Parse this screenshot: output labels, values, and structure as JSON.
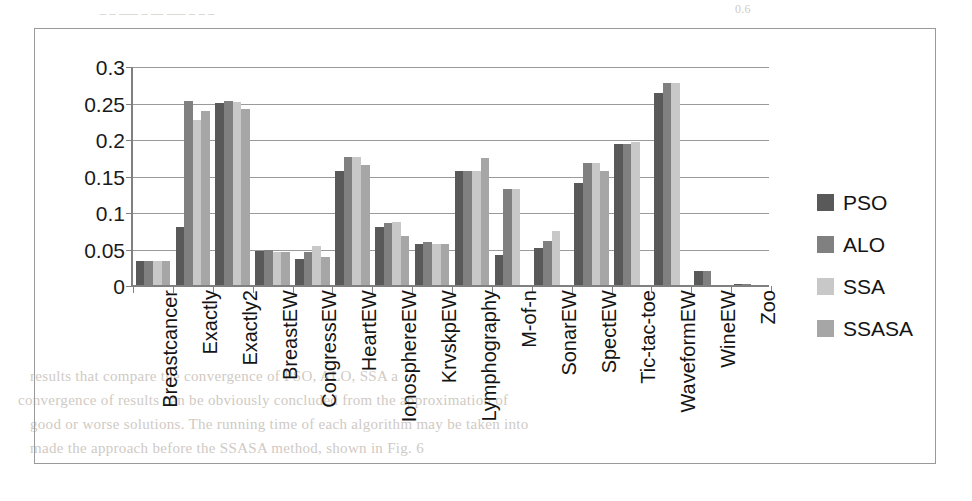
{
  "page_bleed": {
    "top_left": "_  _   ___ _ __  ___ _ _ _",
    "top_right": "0.6",
    "lines": [
      "results that compare the convergence of PSO, ALO, SSA a",
      "convergence of results can be obviously concluded from the approximation of",
      "good or worse solutions. The running time of each algorithm may be taken into",
      "made the approach before the SSASA method, shown in Fig. 6"
    ]
  },
  "chart_data": {
    "type": "bar",
    "title": "",
    "xlabel": "",
    "ylabel": "",
    "ylim": [
      0,
      0.3
    ],
    "yticks": [
      "0",
      "0.05",
      "0.1",
      "0.15",
      "0.2",
      "0.25",
      "0.3"
    ],
    "ytick_values": [
      0,
      0.05,
      0.1,
      0.15,
      0.2,
      0.25,
      0.3
    ],
    "grid": true,
    "legend_position": "right",
    "categories": [
      "Breastcancer",
      "Exactly",
      "Exactly2",
      "BreastEW",
      "CongressEW",
      "HeartEW",
      "IonosphereEW",
      "KrvskpEW",
      "Lymphography",
      "M-of-n",
      "SonarEW",
      "SpectEW",
      "Tic-tac-toe",
      "WaveformEW",
      "WineEW",
      "Zoo"
    ],
    "series": [
      {
        "name": "PSO",
        "color": "#595959",
        "values": [
          0.034,
          0.081,
          0.251,
          0.048,
          0.037,
          0.157,
          0.081,
          0.058,
          0.157,
          0.042,
          0.052,
          0.141,
          0.195,
          0.264,
          0.02,
          0.003
        ]
      },
      {
        "name": "ALO",
        "color": "#808080",
        "values": [
          0.034,
          0.254,
          0.253,
          0.05,
          0.046,
          0.177,
          0.086,
          0.06,
          0.157,
          0.133,
          0.062,
          0.168,
          0.195,
          0.278,
          0.02,
          0.003
        ]
      },
      {
        "name": "SSA",
        "color": "#c8c8c8",
        "values": [
          0.034,
          0.228,
          0.252,
          0.046,
          0.055,
          0.177,
          0.088,
          0.058,
          0.157,
          0.133,
          0.076,
          0.168,
          0.197,
          0.278,
          0.0,
          0.0
        ]
      },
      {
        "name": "SSASA",
        "color": "#a6a6a6",
        "values": [
          0.034,
          0.24,
          0.243,
          0.046,
          0.04,
          0.166,
          0.068,
          0.058,
          0.176,
          0.0,
          0.0,
          0.157,
          0.0,
          0.0,
          0.0,
          0.0
        ]
      }
    ]
  }
}
